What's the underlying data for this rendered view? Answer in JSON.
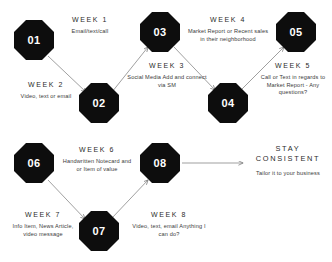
{
  "diagram": {
    "type": "zigzag-flow",
    "nodes": [
      {
        "id": "n1",
        "label": "01",
        "x": 34,
        "y": 40
      },
      {
        "id": "n2",
        "label": "02",
        "x": 99,
        "y": 103
      },
      {
        "id": "n3",
        "label": "03",
        "x": 160,
        "y": 32
      },
      {
        "id": "n4",
        "label": "04",
        "x": 228,
        "y": 103
      },
      {
        "id": "n5",
        "label": "05",
        "x": 296,
        "y": 32
      },
      {
        "id": "n6",
        "label": "06",
        "x": 34,
        "y": 163
      },
      {
        "id": "n7",
        "label": "07",
        "x": 99,
        "y": 231
      },
      {
        "id": "n8",
        "label": "08",
        "x": 160,
        "y": 163
      }
    ],
    "labels": [
      {
        "id": "w1",
        "week": "WEEK 1",
        "desc": "Email/text/call"
      },
      {
        "id": "w2",
        "week": "WEEK 2",
        "desc": "Video, text or email"
      },
      {
        "id": "w3",
        "week": "WEEK 3",
        "desc": "Social Media Add and connect via SM"
      },
      {
        "id": "w4",
        "week": "WEEK 4",
        "desc": "Market Report or Recent sales in their neighborhood"
      },
      {
        "id": "w5",
        "week": "WEEK 5",
        "desc": "Call or Text in regards to Market Report - Any questions?"
      },
      {
        "id": "w6",
        "week": "WEEK 6",
        "desc": "Handwritten Notecard and or Item of value"
      },
      {
        "id": "w7",
        "week": "WEEK 7",
        "desc": "Info Item, News Article, video message"
      },
      {
        "id": "w8",
        "week": "WEEK 8",
        "desc": "Video, text, email Anything I can do?"
      }
    ],
    "endcap": {
      "title": "STAY CONSISTENT",
      "subtitle": "Tailor it to your business"
    },
    "colors": {
      "node_fill": "#0d0d0d",
      "node_text": "#ffffff",
      "edge": "#8a8a8a",
      "background": "#ffffff",
      "text": "#2b2b2b"
    }
  }
}
